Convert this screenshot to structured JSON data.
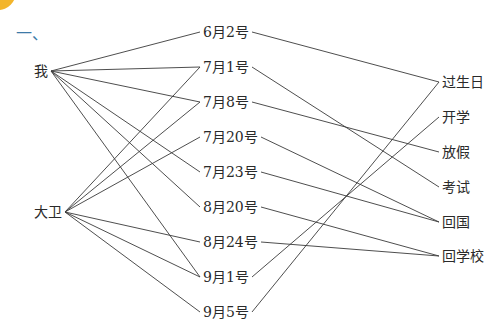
{
  "section_marker": "一、",
  "people": [
    {
      "label": "我",
      "x": 34,
      "y": 71
    },
    {
      "label": "大卫",
      "x": 34,
      "y": 212
    }
  ],
  "dates": [
    {
      "label": "6月2号",
      "x": 203,
      "y": 32
    },
    {
      "label": "7月1号",
      "x": 203,
      "y": 67
    },
    {
      "label": "7月8号",
      "x": 203,
      "y": 102
    },
    {
      "label": "7月20号",
      "x": 203,
      "y": 137
    },
    {
      "label": "7月23号",
      "x": 203,
      "y": 172
    },
    {
      "label": "8月20号",
      "x": 203,
      "y": 207
    },
    {
      "label": "8月24号",
      "x": 203,
      "y": 242
    },
    {
      "label": "9月1号",
      "x": 203,
      "y": 277
    },
    {
      "label": "9月5号",
      "x": 203,
      "y": 312
    }
  ],
  "events": [
    {
      "label": "过生日",
      "x": 442,
      "y": 82
    },
    {
      "label": "开学",
      "x": 442,
      "y": 117
    },
    {
      "label": "放假",
      "x": 442,
      "y": 152
    },
    {
      "label": "考试",
      "x": 442,
      "y": 187
    },
    {
      "label": "回国",
      "x": 442,
      "y": 222
    },
    {
      "label": "回学校",
      "x": 442,
      "y": 256
    }
  ],
  "links_left": [
    [
      0,
      0
    ],
    [
      0,
      1
    ],
    [
      0,
      2
    ],
    [
      0,
      4
    ],
    [
      0,
      5
    ],
    [
      0,
      7
    ],
    [
      1,
      1
    ],
    [
      1,
      2
    ],
    [
      1,
      3
    ],
    [
      1,
      6
    ],
    [
      1,
      7
    ],
    [
      1,
      8
    ]
  ],
  "links_right": [
    [
      0,
      0
    ],
    [
      1,
      3
    ],
    [
      2,
      2
    ],
    [
      3,
      4
    ],
    [
      4,
      4
    ],
    [
      5,
      5
    ],
    [
      6,
      5
    ],
    [
      7,
      1
    ],
    [
      8,
      0
    ]
  ]
}
